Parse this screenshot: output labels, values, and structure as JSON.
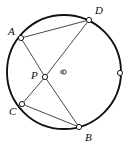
{
  "figure": {
    "width": 131,
    "height": 147,
    "background_color": "#ffffff"
  },
  "circle": {
    "name": "main-circle",
    "center_x": 64,
    "center_y": 72,
    "radius": 57,
    "stroke_color": "#111111",
    "stroke_width": 1.9,
    "fill": "none"
  },
  "center_marker": {
    "label": "o",
    "x": 64,
    "y": 72,
    "radius": 2.2,
    "stroke_color": "#3a3a3a",
    "label_x": 60,
    "label_y": 68
  },
  "points": [
    {
      "id": "A",
      "label": "A",
      "x": 21,
      "y": 38,
      "marker_radius": 2.6,
      "label_x": 8,
      "label_y": 26
    },
    {
      "id": "D",
      "label": "D",
      "x": 89,
      "y": 20,
      "marker_radius": 2.6,
      "label_x": 95,
      "label_y": 5
    },
    {
      "id": "P",
      "label": "P",
      "x": 45,
      "y": 77,
      "marker_radius": 2.6,
      "label_x": 31,
      "label_y": 70
    },
    {
      "id": "C",
      "label": "C",
      "x": 22,
      "y": 104,
      "marker_radius": 2.6,
      "label_x": 9,
      "label_y": 106
    },
    {
      "id": "B",
      "label": "B",
      "x": 79,
      "y": 127,
      "marker_radius": 2.6,
      "label_x": 85,
      "label_y": 132
    },
    {
      "id": "E",
      "label": "",
      "x": 120,
      "y": 73,
      "marker_radius": 2.6,
      "label_x": 0,
      "label_y": 0
    }
  ],
  "segments": [
    {
      "id": "AD",
      "from": "A",
      "to": "D",
      "x1": 21,
      "y1": 38,
      "x2": 89,
      "y2": 20,
      "stroke_color": "#4a4a4a",
      "stroke_width": 1.0
    },
    {
      "id": "AP",
      "from": "A",
      "to": "P",
      "x1": 21,
      "y1": 38,
      "x2": 45,
      "y2": 77,
      "stroke_color": "#4a4a4a",
      "stroke_width": 1.0
    },
    {
      "id": "PB",
      "from": "P",
      "to": "B",
      "x1": 45,
      "y1": 77,
      "x2": 79,
      "y2": 127,
      "stroke_color": "#4a4a4a",
      "stroke_width": 1.0
    },
    {
      "id": "CP",
      "from": "C",
      "to": "P",
      "x1": 22,
      "y1": 104,
      "x2": 45,
      "y2": 77,
      "stroke_color": "#4a4a4a",
      "stroke_width": 1.0
    },
    {
      "id": "PD",
      "from": "P",
      "to": "D",
      "x1": 45,
      "y1": 77,
      "x2": 89,
      "y2": 20,
      "stroke_color": "#4a4a4a",
      "stroke_width": 1.0
    },
    {
      "id": "CB",
      "from": "C",
      "to": "B",
      "x1": 22,
      "y1": 104,
      "x2": 79,
      "y2": 127,
      "stroke_color": "#4a4a4a",
      "stroke_width": 1.0
    }
  ],
  "marker_style": {
    "fill": "#ffffff",
    "stroke_color": "#1a1a1a",
    "stroke_width": 1.0
  }
}
